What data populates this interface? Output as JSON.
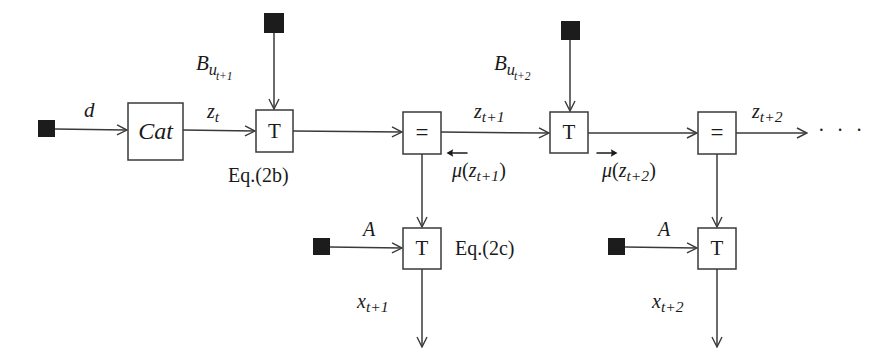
{
  "figure": {
    "type": "block-diagram",
    "background_color": "#ffffff",
    "line_color": "#3a3a3a",
    "text_color": "#1a1a1a"
  },
  "nodes": {
    "cat_block": {
      "label": "Cat",
      "x": 128,
      "y": 103,
      "w": 55,
      "h": 57
    },
    "t_block_1": {
      "label": "T",
      "x": 256,
      "y": 110,
      "w": 37,
      "h": 42
    },
    "equals_block_1": {
      "label": "=",
      "x": 403,
      "y": 112,
      "w": 38,
      "h": 42
    },
    "t_block_2": {
      "label": "T",
      "x": 550,
      "y": 112,
      "w": 38,
      "h": 41
    },
    "equals_block_2": {
      "label": "=",
      "x": 698,
      "y": 112,
      "w": 38,
      "h": 42
    },
    "t_block_3": {
      "label": "T",
      "x": 403,
      "y": 228,
      "w": 38,
      "h": 41
    },
    "t_block_4": {
      "label": "T",
      "x": 698,
      "y": 228,
      "w": 38,
      "h": 41
    }
  },
  "terminals": [
    {
      "name": "terminal-input-d",
      "x": 38,
      "y": 120,
      "size": 17
    },
    {
      "name": "terminal-input-bu1",
      "x": 264,
      "y": 13,
      "size": 20
    },
    {
      "name": "terminal-input-bu2",
      "x": 561,
      "y": 21,
      "size": 19
    },
    {
      "name": "terminal-input-a1",
      "x": 313,
      "y": 238,
      "size": 17
    },
    {
      "name": "terminal-input-a2",
      "x": 608,
      "y": 238,
      "size": 17
    }
  ],
  "edge_labels": {
    "d": "d",
    "z_t": {
      "base": "z",
      "sub": "t"
    },
    "z_t1": {
      "base": "z",
      "sub": "t+1"
    },
    "z_t2": {
      "base": "z",
      "sub": "t+2"
    },
    "b_u_t1": {
      "base": "B",
      "sub": "u",
      "subsub": "t+1"
    },
    "b_u_t2": {
      "base": "B",
      "sub": "u",
      "subsub": "t+2"
    },
    "a_left": "A",
    "a_right": "A",
    "x_t1": {
      "base": "x",
      "sub": "t+1"
    },
    "x_t2": {
      "base": "x",
      "sub": "t+2"
    },
    "mu_backward": {
      "symbol": "μ",
      "accent": "left-arrow",
      "arg_base": "z",
      "arg_sub": "t+1"
    },
    "mu_forward": {
      "symbol": "μ",
      "accent": "right-arrow",
      "arg_base": "z",
      "arg_sub": "t+2"
    }
  },
  "annotations": {
    "eq_2b": "Eq.(2b)",
    "eq_2c": "Eq.(2c)",
    "ellipsis": "· · ·"
  }
}
